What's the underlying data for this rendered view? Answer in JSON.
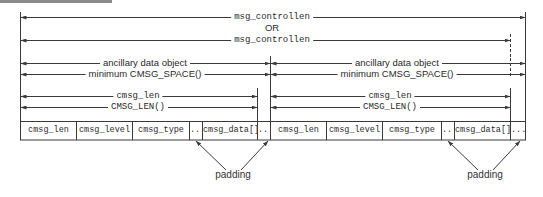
{
  "diagram": {
    "top_labels": {
      "msg_controllen_1": "msg_controllen",
      "or": "OR",
      "msg_controllen_2": "msg_controllen"
    },
    "objects": [
      {
        "ancillary_label": "ancillary data object",
        "space_label": "minimum CMSG_SPACE()",
        "cmsg_len_label": "cmsg_len",
        "cmsg_len_macro": "CMSG_LEN()",
        "cells": [
          "cmsg_len",
          "cmsg_level",
          "cmsg_type",
          "....",
          "cmsg_data[]",
          "...."
        ],
        "padding_label": "padding"
      },
      {
        "ancillary_label": "ancillary data object",
        "space_label": "minimum CMSG_SPACE()",
        "cmsg_len_label": "cmsg_len",
        "cmsg_len_macro": "CMSG_LEN()",
        "cells": [
          "cmsg_len",
          "cmsg_level",
          "cmsg_type",
          "....",
          "cmsg_data[]",
          "...."
        ],
        "padding_label": "padding"
      }
    ],
    "colors": {
      "line": "#3a3a3a",
      "text": "#2a2a2a",
      "background": "#ffffff"
    }
  }
}
